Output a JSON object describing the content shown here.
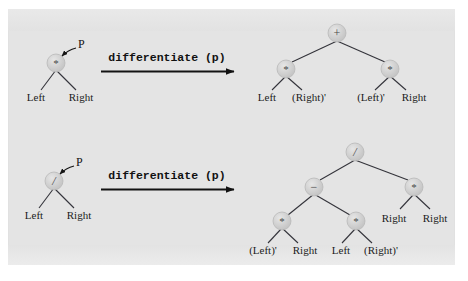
{
  "figure": {
    "background_color": "#e4e4e4",
    "page_color": "#ffffff",
    "node_fill": "#cfcfcf",
    "edge_color": "#33333a",
    "text_color": "#1b1b1b"
  },
  "rows": [
    {
      "id": "product-rule",
      "pointer_label": "P",
      "transform_label": "differentiate (p)",
      "input_tree": {
        "root": {
          "symbol": "*",
          "name": "multiply"
        },
        "leaves": [
          "Left",
          "Right"
        ]
      },
      "output_tree": {
        "root": {
          "symbol": "+",
          "name": "plus"
        },
        "left_child": {
          "symbol": "*",
          "name": "multiply",
          "leaves": [
            "Left",
            "(Right)'"
          ]
        },
        "right_child": {
          "symbol": "*",
          "name": "multiply",
          "leaves": [
            "(Left)'",
            "Right"
          ]
        }
      }
    },
    {
      "id": "quotient-rule",
      "pointer_label": "P",
      "transform_label": "differentiate (p)",
      "input_tree": {
        "root": {
          "symbol": "/",
          "name": "divide"
        },
        "leaves": [
          "Left",
          "Right"
        ]
      },
      "output_tree": {
        "root": {
          "symbol": "/",
          "name": "divide"
        },
        "left_child": {
          "symbol": "−",
          "name": "minus",
          "left_child": {
            "symbol": "*",
            "name": "multiply",
            "leaves": [
              "(Left)'",
              "Right"
            ]
          },
          "right_child": {
            "symbol": "*",
            "name": "multiply",
            "leaves": [
              "Left",
              "(Right)'"
            ]
          }
        },
        "right_child": {
          "symbol": "*",
          "name": "multiply",
          "leaves": [
            "Right",
            "Right"
          ]
        }
      }
    }
  ]
}
